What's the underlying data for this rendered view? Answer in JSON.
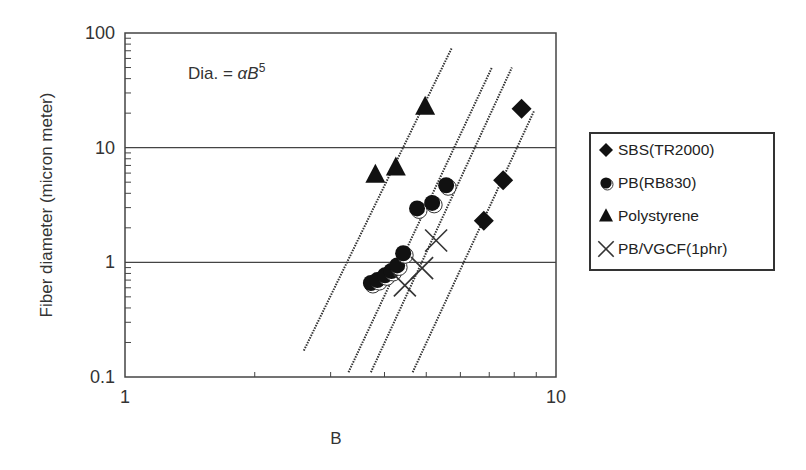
{
  "chart_data": {
    "type": "scatter",
    "title": "",
    "annotation": "Dia. = αB⁵",
    "annotation_parts": {
      "prefix": "Dia. = ",
      "alpha": "α",
      "var": "B",
      "exp": "5"
    },
    "xlabel": "B",
    "ylabel": "Fiber diameter (micron meter)",
    "xscale": "log",
    "yscale": "log",
    "xlim": [
      1,
      10
    ],
    "ylim": [
      0.1,
      100
    ],
    "xticks": [
      "1",
      "10"
    ],
    "yticks": [
      "0.1",
      "1",
      "10",
      "100"
    ],
    "grid": "horizontal lines at 1 and 10",
    "legend_position": "right, outside plot",
    "series": [
      {
        "name": "SBS(TR2000)",
        "marker": "diamond",
        "x": [
          6.8,
          7.54,
          8.32
        ],
        "y": [
          2.3,
          5.2,
          21.8
        ]
      },
      {
        "name": "PB(RB830)",
        "marker": "circle-half",
        "x": [
          3.72,
          3.85,
          4.01,
          4.15,
          4.28,
          4.42,
          4.76,
          5.16,
          5.56
        ],
        "y": [
          0.66,
          0.7,
          0.77,
          0.84,
          0.94,
          1.2,
          2.95,
          3.3,
          4.7
        ]
      },
      {
        "name": "Polystyrene",
        "marker": "triangle",
        "x": [
          3.81,
          4.25,
          4.97
        ],
        "y": [
          5.8,
          6.7,
          22.7
        ]
      },
      {
        "name": "PB/VGCF(1phr)",
        "marker": "x",
        "x": [
          4.46,
          4.89,
          5.27
        ],
        "y": [
          0.63,
          0.89,
          1.55
        ]
      }
    ],
    "fit_lines": [
      {
        "slope_loglog": 5,
        "from": [
          2.6,
          0.17
        ],
        "to": [
          5.74,
          75
        ]
      },
      {
        "slope_loglog": 5,
        "from": [
          3.3,
          0.11
        ],
        "to": [
          7.1,
          50
        ]
      },
      {
        "slope_loglog": 5,
        "from": [
          3.72,
          0.11
        ],
        "to": [
          7.9,
          50
        ]
      },
      {
        "slope_loglog": 5,
        "from": [
          4.65,
          0.11
        ],
        "to": [
          8.9,
          21
        ]
      }
    ]
  }
}
